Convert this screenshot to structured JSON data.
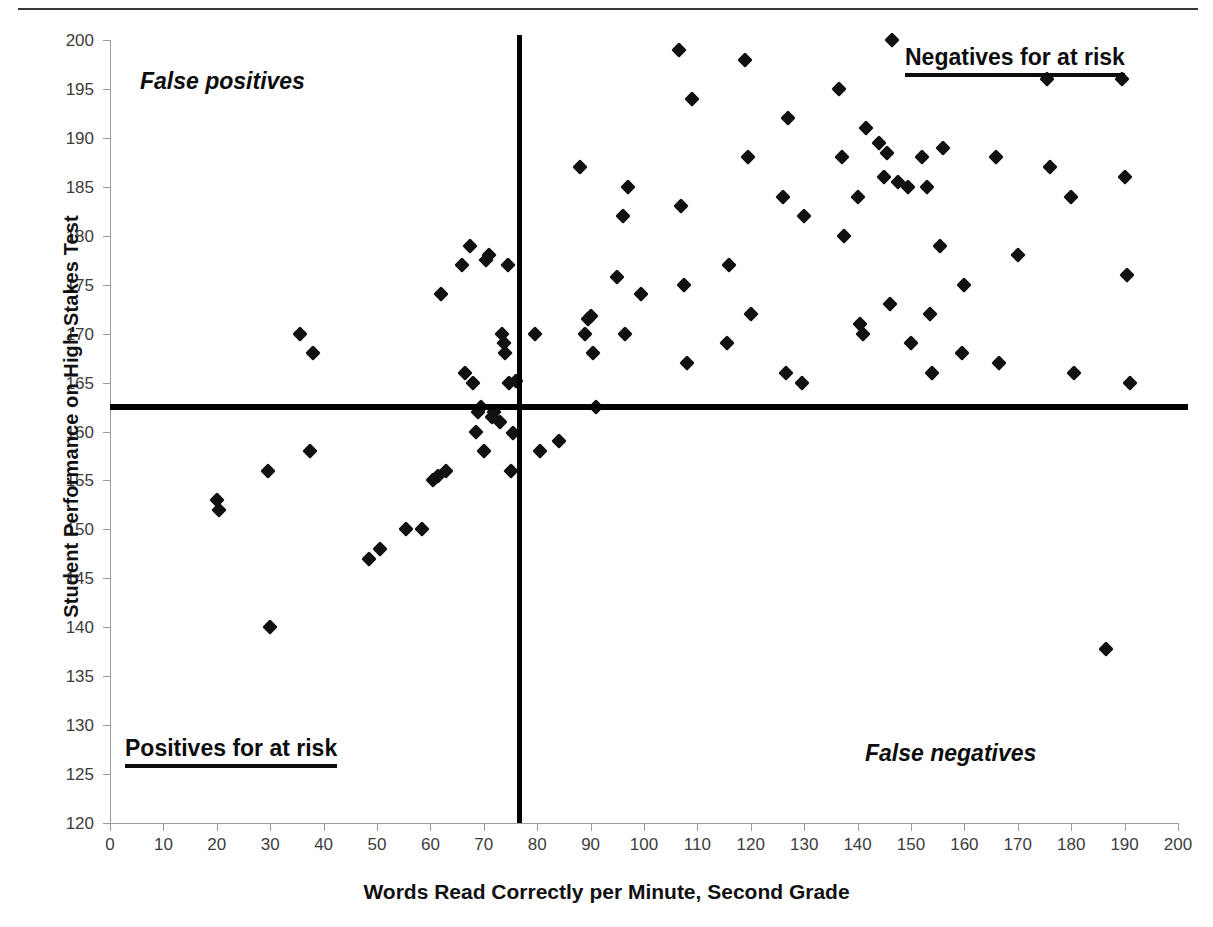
{
  "chart": {
    "type": "scatter",
    "xlabel": "Words Read Correctly per Minute, Second Grade",
    "ylabel": "Student Performance on High-Stakes Test",
    "annotations": {
      "false_positives": "False positives",
      "negatives_for_at_risk": "Negatives for at risk",
      "positives_for_at_risk": "Positives for at risk",
      "false_negatives": "False negatives"
    }
  },
  "chart_data": {
    "type": "scatter",
    "title": "",
    "subtitle": "",
    "xlabel": "Words Read Correctly per Minute, Second Grade",
    "ylabel": "Student Performance on High-Stakes Test",
    "xlim": [
      0,
      200
    ],
    "ylim": [
      120,
      200
    ],
    "xticks": [
      0,
      10,
      20,
      30,
      40,
      50,
      60,
      70,
      80,
      90,
      100,
      110,
      120,
      130,
      140,
      150,
      160,
      170,
      180,
      190,
      200
    ],
    "yticks": [
      120,
      125,
      130,
      135,
      140,
      145,
      150,
      155,
      160,
      165,
      170,
      175,
      180,
      185,
      190,
      195,
      200
    ],
    "grid": false,
    "legend": null,
    "marker": "filled-diamond",
    "marker_color": "#111111",
    "reference_lines": [
      {
        "orientation": "vertical",
        "value": 76.5,
        "color": "#000000",
        "label": "cut score, words read correctly per minute"
      },
      {
        "orientation": "horizontal",
        "value": 162.5,
        "color": "#000000",
        "label": "cut score, high-stakes test"
      }
    ],
    "quadrant_labels": [
      {
        "text": "False positives",
        "quadrant": "upper-left",
        "style": "bold-italic"
      },
      {
        "text": "Negatives for at risk",
        "quadrant": "upper-right",
        "style": "bold-underline"
      },
      {
        "text": "Positives for at risk",
        "quadrant": "lower-left",
        "style": "bold-underline"
      },
      {
        "text": "False negatives",
        "quadrant": "lower-right",
        "style": "bold-italic"
      }
    ],
    "points": [
      [
        20.0,
        153.0
      ],
      [
        20.5,
        152.0
      ],
      [
        29.5,
        156.0
      ],
      [
        30.0,
        140.0
      ],
      [
        35.5,
        170.0
      ],
      [
        37.5,
        158.0
      ],
      [
        38.0,
        168.0
      ],
      [
        48.5,
        147.0
      ],
      [
        50.5,
        148.0
      ],
      [
        55.5,
        150.0
      ],
      [
        58.5,
        150.0
      ],
      [
        60.5,
        155.0
      ],
      [
        61.5,
        155.5
      ],
      [
        62.0,
        174.0
      ],
      [
        63.0,
        156.0
      ],
      [
        66.0,
        177.0
      ],
      [
        66.5,
        166.0
      ],
      [
        67.5,
        179.0
      ],
      [
        68.0,
        165.0
      ],
      [
        68.5,
        160.0
      ],
      [
        69.0,
        162.0
      ],
      [
        69.5,
        162.5
      ],
      [
        70.0,
        158.0
      ],
      [
        70.5,
        177.5
      ],
      [
        71.0,
        178.0
      ],
      [
        71.5,
        161.5
      ],
      [
        72.0,
        162.0
      ],
      [
        73.0,
        161.0
      ],
      [
        73.5,
        170.0
      ],
      [
        73.8,
        169.0
      ],
      [
        74.0,
        168.0
      ],
      [
        74.5,
        177.0
      ],
      [
        74.8,
        165.0
      ],
      [
        75.0,
        156.0
      ],
      [
        75.5,
        159.8
      ],
      [
        76.0,
        165.2
      ],
      [
        79.5,
        170.0
      ],
      [
        80.5,
        158.0
      ],
      [
        84.0,
        159.0
      ],
      [
        88.0,
        187.0
      ],
      [
        89.0,
        170.0
      ],
      [
        89.5,
        171.5
      ],
      [
        90.0,
        171.8
      ],
      [
        90.5,
        168.0
      ],
      [
        91.0,
        162.5
      ],
      [
        95.0,
        175.8
      ],
      [
        96.0,
        182.0
      ],
      [
        96.5,
        170.0
      ],
      [
        97.0,
        185.0
      ],
      [
        99.5,
        174.0
      ],
      [
        106.5,
        199.0
      ],
      [
        107.0,
        183.0
      ],
      [
        107.5,
        175.0
      ],
      [
        108.0,
        167.0
      ],
      [
        109.0,
        194.0
      ],
      [
        115.5,
        169.0
      ],
      [
        116.0,
        177.0
      ],
      [
        119.0,
        198.0
      ],
      [
        119.5,
        188.0
      ],
      [
        120.0,
        172.0
      ],
      [
        126.0,
        184.0
      ],
      [
        126.5,
        166.0
      ],
      [
        127.0,
        192.0
      ],
      [
        129.5,
        165.0
      ],
      [
        130.0,
        182.0
      ],
      [
        136.5,
        195.0
      ],
      [
        137.0,
        188.0
      ],
      [
        137.5,
        180.0
      ],
      [
        140.0,
        184.0
      ],
      [
        140.5,
        171.0
      ],
      [
        141.0,
        170.0
      ],
      [
        141.5,
        191.0
      ],
      [
        144.0,
        189.5
      ],
      [
        145.0,
        186.0
      ],
      [
        145.5,
        188.5
      ],
      [
        146.0,
        173.0
      ],
      [
        146.5,
        200.0
      ],
      [
        147.5,
        185.5
      ],
      [
        149.5,
        185.0
      ],
      [
        150.0,
        169.0
      ],
      [
        152.0,
        188.0
      ],
      [
        153.0,
        185.0
      ],
      [
        153.5,
        172.0
      ],
      [
        154.0,
        166.0
      ],
      [
        155.5,
        179.0
      ],
      [
        156.0,
        189.0
      ],
      [
        159.5,
        168.0
      ],
      [
        160.0,
        175.0
      ],
      [
        166.0,
        188.0
      ],
      [
        166.5,
        167.0
      ],
      [
        170.0,
        178.0
      ],
      [
        175.5,
        196.0
      ],
      [
        176.0,
        187.0
      ],
      [
        180.0,
        184.0
      ],
      [
        180.5,
        166.0
      ],
      [
        186.5,
        137.8
      ],
      [
        189.5,
        196.0
      ],
      [
        190.0,
        186.0
      ],
      [
        190.5,
        176.0
      ],
      [
        191.0,
        165.0
      ]
    ]
  }
}
